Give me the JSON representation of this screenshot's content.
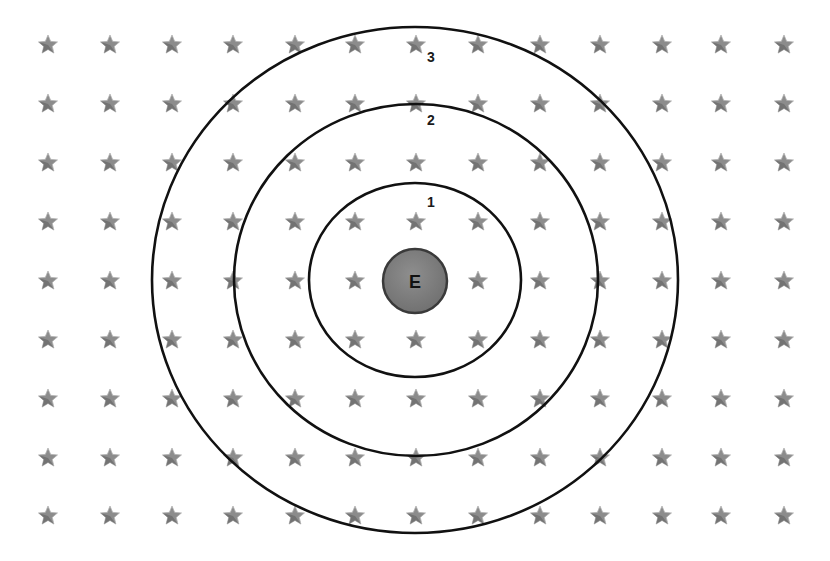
{
  "diagram": {
    "type": "concentric-orbits",
    "center": {
      "label": "E",
      "cx": 415,
      "cy": 281,
      "r": 32,
      "fill": "#7d7d7d",
      "stroke": "#3a3a3a"
    },
    "rings": [
      {
        "label": "1",
        "cx": 415,
        "cy": 280,
        "rx": 106,
        "ry": 97,
        "label_x": 431,
        "label_y": 207
      },
      {
        "label": "2",
        "cx": 416,
        "cy": 280,
        "rx": 182,
        "ry": 176,
        "label_x": 431,
        "label_y": 125
      },
      {
        "label": "3",
        "cx": 415,
        "cy": 280,
        "rx": 263,
        "ry": 253,
        "label_x": 431,
        "label_y": 62
      }
    ],
    "ring_stroke": "#111111",
    "star_grid": {
      "columns_x": [
        48,
        110,
        172,
        233,
        295,
        355,
        416,
        478,
        540,
        600,
        662,
        721,
        784
      ],
      "rows_y": [
        44,
        103,
        162,
        221,
        280,
        339,
        398,
        457,
        515
      ],
      "star_color": "#8c8c8c",
      "star_shade": "#5e5e5e",
      "star_size": 10
    }
  }
}
